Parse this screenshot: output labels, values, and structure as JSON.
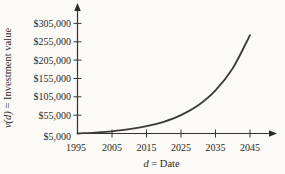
{
  "figure": {
    "background": "#fbfaf6",
    "ink": "#2b2a28",
    "curve_color": "#3c3a38"
  },
  "chart_data": {
    "type": "line",
    "title": "",
    "xlabel": {
      "var": "d",
      "rest": " = Date"
    },
    "ylabel": {
      "var": "v(d)",
      "rest": " = Investment value"
    },
    "grid": false,
    "legend": false,
    "x_axis": {
      "min": 1995,
      "max": 2045,
      "tick_labels": [
        "1995",
        "2005",
        "2015",
        "2025",
        "2035",
        "2045"
      ],
      "arrow": "right"
    },
    "y_axis": {
      "min": 5000,
      "max": 305000,
      "tick_labels": [
        "$305,000",
        "$255,000",
        "$205,000",
        "$155,000",
        "$105,000",
        "$55,000",
        "$5,000"
      ],
      "arrow": "up"
    },
    "series": [
      {
        "name": "investment value v(d)",
        "x": [
          1995,
          2000,
          2005,
          2010,
          2015,
          2020,
          2025,
          2030,
          2035,
          2040,
          2045
        ],
        "y": [
          5000,
          7500,
          11100,
          16600,
          24800,
          37000,
          55100,
          82200,
          122700,
          183000,
          273000
        ]
      }
    ]
  }
}
